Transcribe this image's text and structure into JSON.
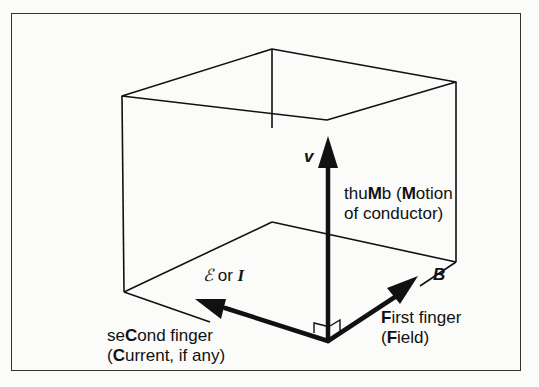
{
  "diagram": {
    "vectors": {
      "motion": {
        "symbol": "v",
        "label_line1_pre": "thu",
        "label_line1_bold": "M",
        "label_line1_mid": "b (",
        "label_line1_bold2": "M",
        "label_line1_post": "otion",
        "label_line2": "of conductor)"
      },
      "field": {
        "symbol": "B",
        "label_line1_bold": "F",
        "label_line1_post": "irst finger",
        "label_line2_pre": "(",
        "label_line2_bold": "F",
        "label_line2_post": "ield)"
      },
      "current": {
        "symbol": "ℰ or I",
        "symbol_emf": "ℰ",
        "symbol_or": " or ",
        "symbol_i": "I",
        "label_line1_pre": "se",
        "label_line1_bold": "C",
        "label_line1_post": "ond finger",
        "label_line2_pre": "(",
        "label_line2_bold": "C",
        "label_line2_post": "urrent, if any)"
      }
    },
    "colors": {
      "line": "#111111",
      "background": "#fbfbfa",
      "frame": "#333333"
    }
  }
}
